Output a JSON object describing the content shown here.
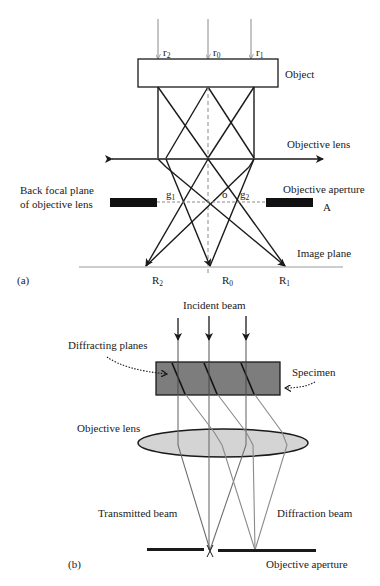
{
  "panel_a": {
    "label": "(a)",
    "rays": {
      "r2": "r",
      "r2_sub": "2",
      "r0": "r",
      "r0_sub": "0",
      "r1": "r",
      "r1_sub": "1"
    },
    "object_label": "Object",
    "lens_label": "Objective lens",
    "aperture_label": "Objective aperture",
    "aperture_letter": "A",
    "bfp_label_line1": "Back focal plane",
    "bfp_label_line2": "of objective lens",
    "g1": "g",
    "g1_sub": "1",
    "origin": "o",
    "g2": "g",
    "g2_sub": "2",
    "image_plane_label": "Image plane",
    "R2": "R",
    "R2_sub": "2",
    "R0": "R",
    "R0_sub": "0",
    "R1": "R",
    "R1_sub": "1"
  },
  "panel_b": {
    "label": "(b)",
    "incident_label": "Incident beam",
    "diffracting_planes_label": "Diffracting planes",
    "specimen_label": "Specimen",
    "lens_label": "Objective lens",
    "transmitted_label": "Transmitted beam",
    "diffraction_label": "Diffraction beam",
    "aperture_label": "Objective aperture"
  },
  "colors": {
    "line": "#1a1a1a",
    "ray_gray": "#8a8a8a",
    "specimen_fill": "#7d7d7d",
    "lens_fill": "#d4d4d4",
    "beam_gray": "#6e6e6e"
  }
}
